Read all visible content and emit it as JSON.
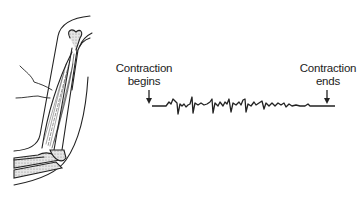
{
  "figure": {
    "illustration": "arm-with-biceps-muscle-and-electrodes",
    "annotations": {
      "start": {
        "line1": "Contraction",
        "line2": "begins"
      },
      "end": {
        "line1": "Contraction",
        "line2": "ends"
      }
    },
    "colors": {
      "line": "#222222",
      "bone_fill": "#cfcfcf",
      "background": "#ffffff"
    }
  }
}
